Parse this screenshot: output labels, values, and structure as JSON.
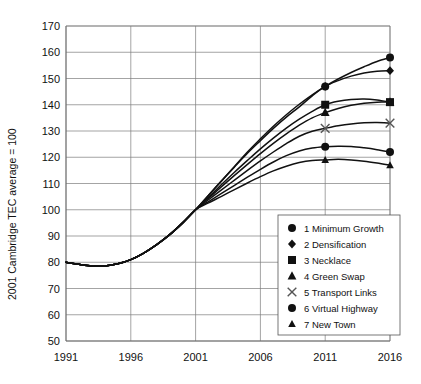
{
  "chart_data": {
    "type": "line",
    "title": "",
    "xlabel": "",
    "ylabel": "2001 Cambridge TEC average = 100",
    "xlim": [
      1991,
      2016
    ],
    "ylim": [
      50,
      170
    ],
    "xticks": [
      "1991",
      "1996",
      "2001",
      "2006",
      "2011",
      "2016"
    ],
    "yticks": [
      "50",
      "60",
      "70",
      "80",
      "90",
      "100",
      "110",
      "120",
      "130",
      "140",
      "150",
      "160",
      "170"
    ],
    "grid": true,
    "legend_position": "lower-right-inside",
    "x": [
      1991,
      1992,
      1993,
      1994,
      1995,
      1996,
      1997,
      1998,
      1999,
      2000,
      2001,
      2002,
      2003,
      2004,
      2005,
      2006,
      2007,
      2008,
      2009,
      2010,
      2011,
      2012,
      2013,
      2014,
      2015,
      2016
    ],
    "series": [
      {
        "name": "1 Minimum Growth",
        "number": 1,
        "marker": "circle",
        "marker_points": [
          [
            2011,
            147
          ],
          [
            2016,
            158
          ]
        ],
        "values": [
          80,
          79.2,
          78.6,
          78.6,
          79.4,
          81,
          83.5,
          86.7,
          90.5,
          95,
          100,
          105.5,
          111,
          116.5,
          122,
          127,
          131.8,
          136.2,
          140.2,
          143.8,
          147,
          149.8,
          152.3,
          154.5,
          156.5,
          158
        ]
      },
      {
        "name": "2 Densification",
        "number": 2,
        "marker": "diamond",
        "marker_points": [
          [
            2011,
            147
          ],
          [
            2016,
            153
          ]
        ],
        "values": [
          80,
          79.2,
          78.6,
          78.6,
          79.4,
          81,
          83.5,
          86.7,
          90.5,
          95,
          100,
          105.5,
          111,
          116.3,
          121.5,
          126.3,
          131,
          135.3,
          139.2,
          143.4,
          147,
          149.2,
          150.9,
          152.1,
          152.8,
          153
        ]
      },
      {
        "name": "3 Necklace",
        "number": 3,
        "marker": "square",
        "marker_points": [
          [
            2011,
            140
          ],
          [
            2016,
            141
          ]
        ],
        "values": [
          80,
          79.2,
          78.6,
          78.6,
          79.4,
          81,
          83.5,
          86.7,
          90.5,
          95,
          100,
          104.8,
          109.6,
          114.3,
          118.8,
          123.2,
          127.3,
          131.1,
          134.5,
          137.5,
          140,
          141.3,
          142,
          142.2,
          141.8,
          141
        ]
      },
      {
        "name": "4 Green Swap",
        "number": 4,
        "marker": "triangle",
        "marker_points": [
          [
            2011,
            137
          ],
          [
            2016,
            141
          ]
        ],
        "values": [
          80,
          79.2,
          78.6,
          78.6,
          79.4,
          81,
          83.5,
          86.7,
          90.5,
          95,
          100,
          104.4,
          108.8,
          113.1,
          117.3,
          121.4,
          125.3,
          128.9,
          132.2,
          135,
          137,
          138.6,
          139.8,
          140.6,
          141,
          141
        ]
      },
      {
        "name": "5 Transport Links",
        "number": 5,
        "marker": "cross",
        "marker_points": [
          [
            2011,
            131
          ],
          [
            2016,
            133
          ]
        ],
        "values": [
          80,
          79.2,
          78.6,
          78.6,
          79.4,
          81,
          83.5,
          86.7,
          90.5,
          95,
          100,
          103.8,
          107.6,
          111.3,
          115,
          118.6,
          122,
          125.2,
          128,
          129.9,
          131,
          132,
          132.7,
          133.1,
          133.2,
          133
        ]
      },
      {
        "name": "6 Virtual Highway",
        "number": 6,
        "marker": "circle",
        "marker_points": [
          [
            2011,
            124
          ],
          [
            2016,
            122
          ]
        ],
        "values": [
          80,
          79.2,
          78.6,
          78.6,
          79.4,
          81,
          83.5,
          86.7,
          90.5,
          95,
          100,
          103.1,
          106.2,
          109.3,
          112.4,
          115.4,
          118.2,
          120.6,
          122.4,
          123.5,
          124,
          124.2,
          124.1,
          123.6,
          122.9,
          122
        ]
      },
      {
        "name": "7 New Town",
        "number": 7,
        "marker": "triangle-small",
        "marker_points": [
          [
            2011,
            119
          ],
          [
            2016,
            117
          ]
        ],
        "values": [
          80,
          79.2,
          78.6,
          78.6,
          79.4,
          81,
          83.5,
          86.7,
          90.5,
          95,
          100,
          102.6,
          105.1,
          107.7,
          110.2,
          112.6,
          114.8,
          116.6,
          118,
          118.8,
          119,
          119.2,
          119,
          118.5,
          117.8,
          117
        ]
      }
    ],
    "legend": [
      {
        "marker": "circle",
        "label": "1 Minimum Growth"
      },
      {
        "marker": "diamond",
        "label": "2 Densification"
      },
      {
        "marker": "square",
        "label": "3 Necklace"
      },
      {
        "marker": "triangle",
        "label": "4 Green Swap"
      },
      {
        "marker": "cross",
        "label": "5 Transport Links"
      },
      {
        "marker": "circle",
        "label": "6 Virtual Highway"
      },
      {
        "marker": "triangle-small",
        "label": "7 New Town"
      }
    ],
    "colors": {
      "line": "#111111",
      "grid": "#7d7d7d",
      "axis": "#6a6a6a",
      "background": "#ffffff"
    }
  }
}
